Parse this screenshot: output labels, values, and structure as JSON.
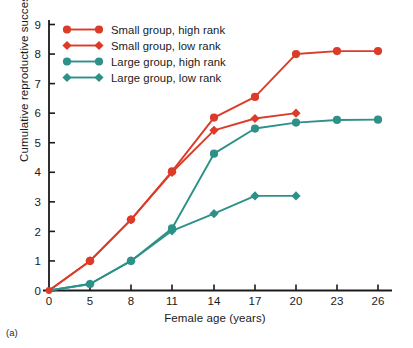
{
  "panel": {
    "id": "(a)"
  },
  "chart_data": {
    "type": "line",
    "title": "",
    "xlabel": "Female age (years)",
    "ylabel": "Cumulative reproductive success",
    "x": [
      0,
      5,
      8,
      11,
      14,
      17,
      20,
      23,
      26
    ],
    "xtick_labels": [
      "0",
      "5",
      "8",
      "11",
      "14",
      "17",
      "20",
      "23",
      "26"
    ],
    "ytick_labels": [
      "0",
      "1",
      "2",
      "3",
      "4",
      "5",
      "6",
      "7",
      "8",
      "9"
    ],
    "ylim": [
      0,
      9
    ],
    "grid": false,
    "legend_position": "upper-left-inside",
    "colors": {
      "red": "#DB3B28",
      "teal": "#2E9189"
    },
    "series": [
      {
        "name": "Small group, high rank",
        "color": "#DB3B28",
        "marker": "circle",
        "x": [
          0,
          5,
          8,
          11,
          14,
          17,
          20,
          23,
          26
        ],
        "values": [
          0,
          1.0,
          2.4,
          4.03,
          5.85,
          6.55,
          8.0,
          8.1,
          8.1
        ]
      },
      {
        "name": "Small group, low rank",
        "color": "#DB3B28",
        "marker": "diamond",
        "x": [
          0,
          5,
          8,
          11,
          14,
          17,
          20
        ],
        "values": [
          0,
          1.0,
          2.4,
          4.0,
          5.42,
          5.82,
          6.0
        ]
      },
      {
        "name": "Large group, high rank",
        "color": "#2E9189",
        "marker": "circle",
        "x": [
          0,
          5,
          8,
          11,
          14,
          17,
          20,
          23,
          26
        ],
        "values": [
          0,
          0.22,
          1.0,
          2.1,
          4.63,
          5.48,
          5.68,
          5.77,
          5.78
        ]
      },
      {
        "name": "Large group, low rank",
        "color": "#2E9189",
        "marker": "diamond",
        "x": [
          0,
          5,
          8,
          11,
          14,
          17,
          20
        ],
        "values": [
          0,
          0.22,
          1.0,
          2.02,
          2.6,
          3.2,
          3.2
        ]
      }
    ]
  }
}
